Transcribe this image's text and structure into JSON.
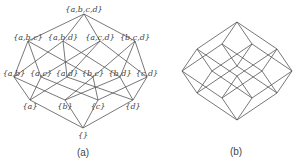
{
  "figure_a": {
    "caption": "(a)",
    "nodes": [
      {
        "id": "empty",
        "label": "{}",
        "x": 83,
        "y": 135,
        "ax": 83,
        "ay": 128
      },
      {
        "id": "a",
        "label": "{a}",
        "x": 30,
        "y": 106,
        "ax": 30,
        "ay": 100
      },
      {
        "id": "b",
        "label": "{b}",
        "x": 65,
        "y": 106,
        "ax": 65,
        "ay": 100
      },
      {
        "id": "c",
        "label": "{c}",
        "x": 98,
        "y": 106,
        "ax": 98,
        "ay": 100
      },
      {
        "id": "d",
        "label": "{d}",
        "x": 133,
        "y": 106,
        "ax": 133,
        "ay": 100
      },
      {
        "id": "ab",
        "label": "{a,b}",
        "x": 14,
        "y": 73,
        "ax": 14,
        "ay": 77
      },
      {
        "id": "ac",
        "label": "{a,c}",
        "x": 41,
        "y": 73,
        "ax": 41,
        "ay": 77
      },
      {
        "id": "ad",
        "label": "{a,d}",
        "x": 67,
        "y": 73,
        "ax": 67,
        "ay": 77
      },
      {
        "id": "bc",
        "label": "{b,c}",
        "x": 93,
        "y": 73,
        "ax": 93,
        "ay": 77
      },
      {
        "id": "bd",
        "label": "{b,d}",
        "x": 120,
        "y": 73,
        "ax": 120,
        "ay": 77
      },
      {
        "id": "cd",
        "label": "{c,d}",
        "x": 147,
        "y": 73,
        "ax": 147,
        "ay": 77
      },
      {
        "id": "abc",
        "label": "{a,b,c}",
        "x": 28,
        "y": 37,
        "ax": 28,
        "ay": 41
      },
      {
        "id": "abd",
        "label": "{a,b,d}",
        "x": 63,
        "y": 37,
        "ax": 63,
        "ay": 41
      },
      {
        "id": "acd",
        "label": "{a,c,d}",
        "x": 100,
        "y": 37,
        "ax": 100,
        "ay": 41
      },
      {
        "id": "bcd",
        "label": "{b,c,d}",
        "x": 135,
        "y": 37,
        "ax": 135,
        "ay": 41
      },
      {
        "id": "abcd",
        "label": "{a,b,c,d}",
        "x": 84,
        "y": 9,
        "ax": 84,
        "ay": 14
      }
    ],
    "edges": [
      [
        "empty",
        "a"
      ],
      [
        "empty",
        "b"
      ],
      [
        "empty",
        "c"
      ],
      [
        "empty",
        "d"
      ],
      [
        "a",
        "ab"
      ],
      [
        "a",
        "ac"
      ],
      [
        "a",
        "ad"
      ],
      [
        "b",
        "ab"
      ],
      [
        "b",
        "bc"
      ],
      [
        "b",
        "bd"
      ],
      [
        "c",
        "ac"
      ],
      [
        "c",
        "bc"
      ],
      [
        "c",
        "cd"
      ],
      [
        "d",
        "ad"
      ],
      [
        "d",
        "bd"
      ],
      [
        "d",
        "cd"
      ],
      [
        "ab",
        "abc"
      ],
      [
        "ab",
        "abd"
      ],
      [
        "ac",
        "abc"
      ],
      [
        "ac",
        "acd"
      ],
      [
        "ad",
        "abd"
      ],
      [
        "ad",
        "acd"
      ],
      [
        "bc",
        "abc"
      ],
      [
        "bc",
        "bcd"
      ],
      [
        "bd",
        "abd"
      ],
      [
        "bd",
        "bcd"
      ],
      [
        "cd",
        "acd"
      ],
      [
        "cd",
        "bcd"
      ],
      [
        "abc",
        "abcd"
      ],
      [
        "abd",
        "abcd"
      ],
      [
        "acd",
        "abcd"
      ],
      [
        "bcd",
        "abcd"
      ]
    ]
  },
  "figure_b": {
    "caption": "(b)",
    "origin": [
      237,
      120
    ],
    "vectors": {
      "a": [
        -40,
        -27
      ],
      "b": [
        -15,
        -22
      ],
      "c": [
        15,
        -22
      ],
      "d": [
        40,
        -27
      ]
    }
  },
  "captions": {
    "a": "(a)",
    "b": "(b)"
  }
}
